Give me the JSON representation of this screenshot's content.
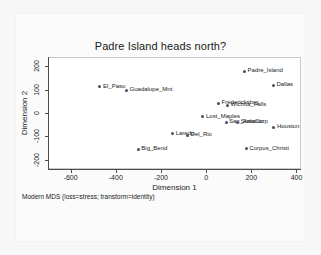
{
  "chart_data": {
    "type": "scatter",
    "title": "Padre Island heads north?",
    "xlabel": "Dimension 1",
    "ylabel": "Dimension 2",
    "caption": "Modern MDS (loss=stress; transform=identity)",
    "xlim": [
      -700,
      420
    ],
    "ylim": [
      -240,
      240
    ],
    "xticks": [
      -600,
      -400,
      -200,
      0,
      200,
      400
    ],
    "xticklabels": [
      "-600",
      "-400",
      "-200",
      "0",
      "200",
      "400"
    ],
    "yticks": [
      200,
      100,
      0,
      -100,
      -200
    ],
    "yticklabels": [
      "200",
      "100",
      "0",
      "-100",
      "-200"
    ],
    "grid": false,
    "legend": "none",
    "marker_color": "#4a4a6a",
    "points": [
      {
        "label": "Padre_Island",
        "x": 170,
        "y": 178
      },
      {
        "label": "Dallas",
        "x": 298,
        "y": 118
      },
      {
        "label": "El_Paso",
        "x": -470,
        "y": 113
      },
      {
        "label": "Guadalupe_Mnt",
        "x": -352,
        "y": 97
      },
      {
        "label": "Fredericksbrg",
        "x": 55,
        "y": 42
      },
      {
        "label": "Wichita_Falls",
        "x": 95,
        "y": 33
      },
      {
        "label": "Lost_Maples",
        "x": -14,
        "y": -16
      },
      {
        "label": "San_Antonio",
        "x": 88,
        "y": -40
      },
      {
        "label": "StataCorp",
        "x": 140,
        "y": -40
      },
      {
        "label": "Houston",
        "x": 300,
        "y": -60
      },
      {
        "label": "Laredo",
        "x": -148,
        "y": -88
      },
      {
        "label": "Del_Rio",
        "x": -82,
        "y": -95
      },
      {
        "label": "Big_Bend",
        "x": -300,
        "y": -155
      },
      {
        "label": "Corpus_Christi",
        "x": 178,
        "y": -153
      }
    ]
  }
}
